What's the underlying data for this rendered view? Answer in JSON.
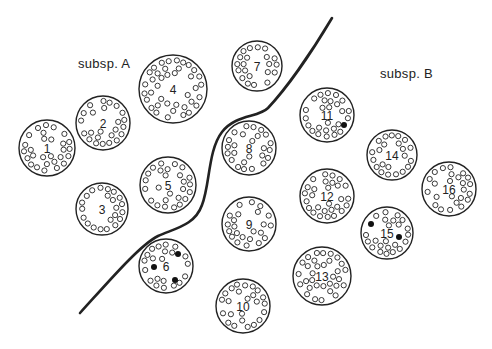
{
  "labels": {
    "subsp_a": "subsp. A",
    "subsp_b": "subsp. B"
  },
  "label_positions": {
    "subsp_a": {
      "x": 78,
      "y": 56
    },
    "subsp_b": {
      "x": 380,
      "y": 66
    }
  },
  "colors": {
    "stroke": "#222222",
    "background": "#ffffff",
    "filled_dot": "#111111"
  },
  "boundary_curve": {
    "description": "Thick line separating subsp. A from subsp. B",
    "path": "M 80 313 C 110 280, 140 245, 158 236 C 176 228, 195 225, 202 205 C 210 185, 208 150, 222 132 C 236 114, 258 118, 268 108 C 285 90, 310 55, 332 18"
  },
  "sections": [
    {
      "id": 1,
      "group": "A",
      "cx": 47,
      "cy": 148,
      "r": 28,
      "filled_dots": 0
    },
    {
      "id": 2,
      "group": "A",
      "cx": 103,
      "cy": 123,
      "r": 27,
      "filled_dots": 0
    },
    {
      "id": 3,
      "group": "A",
      "cx": 102,
      "cy": 209,
      "r": 26,
      "filled_dots": 0
    },
    {
      "id": 4,
      "group": "A",
      "cx": 173,
      "cy": 89,
      "r": 34,
      "filled_dots": 0
    },
    {
      "id": 5,
      "group": "A",
      "cx": 168,
      "cy": 185,
      "r": 28,
      "filled_dots": 0
    },
    {
      "id": 6,
      "group": "A",
      "cx": 166,
      "cy": 266,
      "r": 27,
      "filled_dots": 3
    },
    {
      "id": 7,
      "group": "B",
      "cx": 257,
      "cy": 66,
      "r": 25,
      "filled_dots": 0
    },
    {
      "id": 8,
      "group": "B",
      "cx": 249,
      "cy": 148,
      "r": 27,
      "filled_dots": 0
    },
    {
      "id": 9,
      "group": "B",
      "cx": 249,
      "cy": 224,
      "r": 27,
      "filled_dots": 0
    },
    {
      "id": 10,
      "group": "B",
      "cx": 243,
      "cy": 306,
      "r": 27,
      "filled_dots": 0
    },
    {
      "id": 11,
      "group": "B",
      "cx": 327,
      "cy": 115,
      "r": 27,
      "filled_dots": 1
    },
    {
      "id": 12,
      "group": "B",
      "cx": 327,
      "cy": 196,
      "r": 27,
      "filled_dots": 0
    },
    {
      "id": 13,
      "group": "B",
      "cx": 322,
      "cy": 276,
      "r": 29,
      "filled_dots": 0
    },
    {
      "id": 14,
      "group": "B",
      "cx": 392,
      "cy": 155,
      "r": 25,
      "filled_dots": 0
    },
    {
      "id": 15,
      "group": "B",
      "cx": 387,
      "cy": 233,
      "r": 26,
      "filled_dots": 2
    },
    {
      "id": 16,
      "group": "B",
      "cx": 449,
      "cy": 189,
      "r": 27,
      "filled_dots": 0
    }
  ],
  "filled_dot_positions": {
    "6": [
      [
        -12,
        1
      ],
      [
        12,
        -12
      ],
      [
        9,
        14
      ]
    ],
    "11": [
      [
        17,
        10
      ]
    ],
    "15": [
      [
        -16,
        -9
      ],
      [
        12,
        4
      ]
    ]
  }
}
